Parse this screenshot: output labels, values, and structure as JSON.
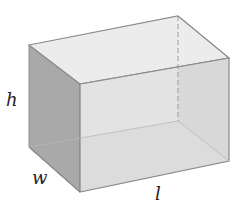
{
  "figure": {
    "labels": {
      "height": "h",
      "width": "w",
      "length": "l"
    },
    "colors": {
      "edge": "#8a8a8a",
      "top_face": "#ebebeb",
      "front_face": "#dcdcdc",
      "left_face": "#a9a9a9",
      "right_back_face": "#cfcfcf",
      "bottom_face": "#e4e4e4",
      "hidden_edge": "#9a9a9a"
    }
  }
}
